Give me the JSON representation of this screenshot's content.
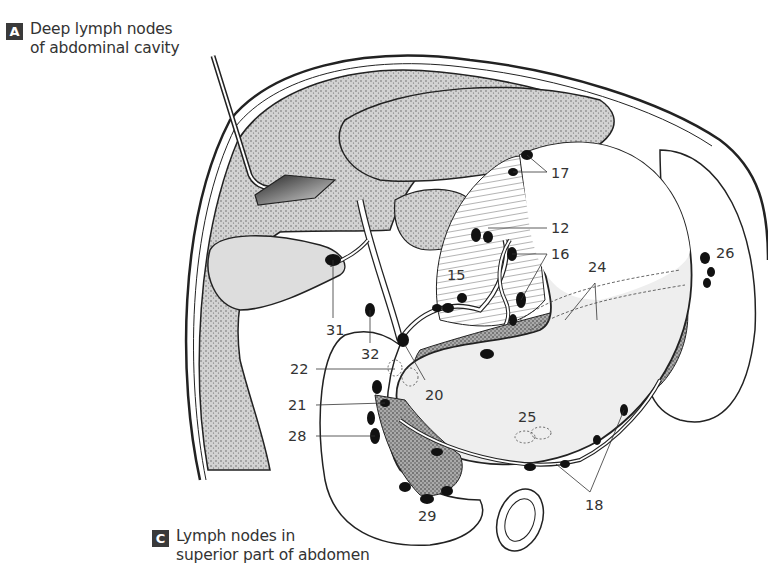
{
  "figure": {
    "caption_a": {
      "badge": "A",
      "line1": "Deep lymph nodes",
      "line2": "of abdominal cavity"
    },
    "caption_c": {
      "badge": "C",
      "line1": "Lymph nodes in",
      "line2": "superior part of abdomen"
    },
    "labels": [
      {
        "id": "17",
        "text": "17",
        "x": 550,
        "y": 166
      },
      {
        "id": "12",
        "text": "12",
        "x": 550,
        "y": 220
      },
      {
        "id": "16",
        "text": "16",
        "x": 550,
        "y": 246
      },
      {
        "id": "15",
        "text": "15",
        "x": 447,
        "y": 267
      },
      {
        "id": "24",
        "text": "24",
        "x": 588,
        "y": 258
      },
      {
        "id": "26",
        "text": "26",
        "x": 716,
        "y": 245
      },
      {
        "id": "31",
        "text": "31",
        "x": 327,
        "y": 322
      },
      {
        "id": "32",
        "text": "32",
        "x": 362,
        "y": 346
      },
      {
        "id": "22",
        "text": "22",
        "x": 290,
        "y": 361
      },
      {
        "id": "20",
        "text": "20",
        "x": 425,
        "y": 387
      },
      {
        "id": "21",
        "text": "21",
        "x": 288,
        "y": 397
      },
      {
        "id": "25",
        "text": "25",
        "x": 518,
        "y": 409
      },
      {
        "id": "28",
        "text": "28",
        "x": 288,
        "y": 428
      },
      {
        "id": "18",
        "text": "18",
        "x": 585,
        "y": 497
      },
      {
        "id": "29",
        "text": "29",
        "x": 418,
        "y": 508
      }
    ]
  }
}
